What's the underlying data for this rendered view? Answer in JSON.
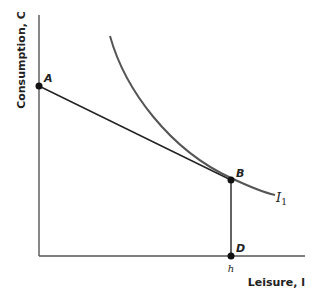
{
  "diagram": {
    "type": "labor-leisure choice",
    "y_axis": {
      "label": "Consumption, C"
    },
    "x_axis": {
      "label": "Leisure, l"
    },
    "points": [
      {
        "id": "A",
        "label": "A",
        "x": 39,
        "y": 86
      },
      {
        "id": "B",
        "label": "B",
        "x": 231,
        "y": 180
      },
      {
        "id": "D",
        "label": "D",
        "x": 231,
        "y": 256
      }
    ],
    "indifference_curve": {
      "label": "I",
      "subscript": "1"
    },
    "tick": {
      "label": "h",
      "x": 231
    },
    "colors": {
      "axis": "#444444",
      "budget_line": "#222222",
      "curve": "#555555",
      "point": "#111111"
    }
  }
}
